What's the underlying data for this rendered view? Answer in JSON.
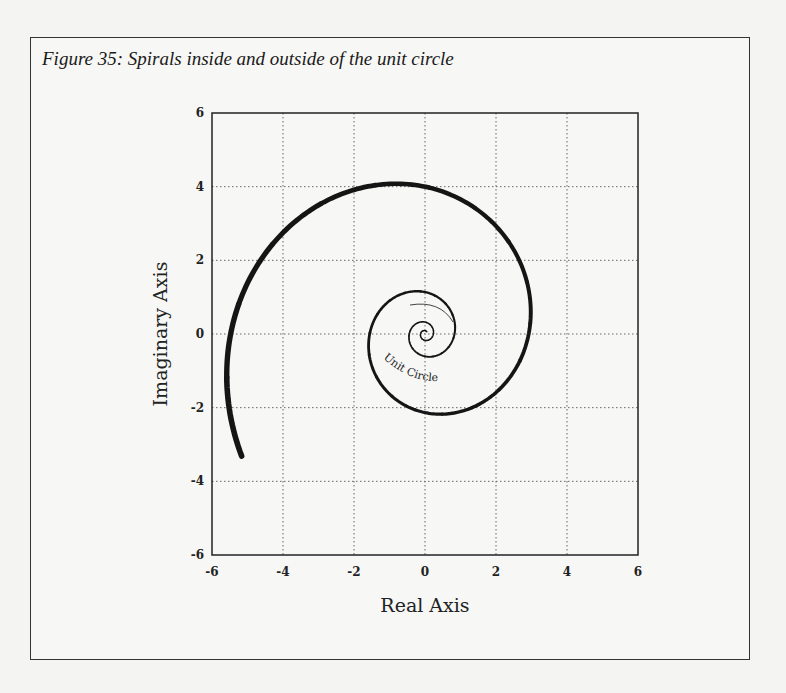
{
  "figure": {
    "caption": "Figure 35: Spirals inside and outside of the unit circle"
  },
  "chart_data": {
    "type": "line",
    "title": "Figure 35: Spirals inside and outside of the unit circle",
    "xlabel": "Real Axis",
    "ylabel": "Imaginary Axis",
    "xlim": [
      -6,
      6
    ],
    "ylim": [
      -6,
      6
    ],
    "xticks": [
      -6,
      -4,
      -2,
      0,
      2,
      4,
      6
    ],
    "yticks": [
      -6,
      -4,
      -2,
      0,
      2,
      4,
      6
    ],
    "xtick_labels": [
      "-6",
      "-4",
      "-2",
      "0",
      "2",
      "4",
      "6"
    ],
    "ytick_labels": [
      "-6",
      "-4",
      "-2",
      "0",
      "2",
      "4",
      "6"
    ],
    "grid": true,
    "annotation": "Unit Circle",
    "series": [
      {
        "name": "logarithmic spiral",
        "form": "r = r0 * exp(k * theta)",
        "r0": 0.08,
        "k": 0.2,
        "theta_start": 0,
        "theta_end": 21.7,
        "key_points": [
          {
            "x": 0.5,
            "y": 4.3
          },
          {
            "x": 3.1,
            "y": 0.3
          },
          {
            "x": 0.2,
            "y": -2.3
          },
          {
            "x": -1.6,
            "y": 0.0
          },
          {
            "x": -5.3,
            "y": -3.4
          }
        ]
      }
    ]
  }
}
